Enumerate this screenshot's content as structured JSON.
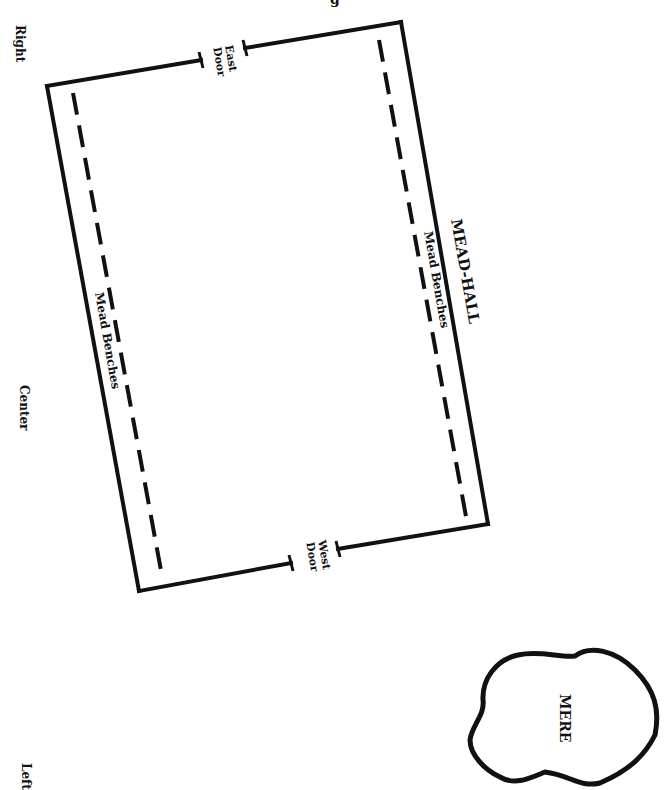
{
  "title_fragment": "g",
  "side_labels": {
    "right": "Right",
    "center": "Center",
    "left": "Left"
  },
  "hall": {
    "label": "MEAD-HALL",
    "benches": {
      "east_side": "Mead Benches",
      "west_side": "Mead Benches"
    },
    "doors": {
      "east": {
        "line1": "East",
        "line2": "Door"
      },
      "west": {
        "line1": "West",
        "line2": "Door"
      }
    }
  },
  "mere": {
    "label": "MERE"
  },
  "colors": {
    "ink": "#111111",
    "background": "#ffffff"
  }
}
